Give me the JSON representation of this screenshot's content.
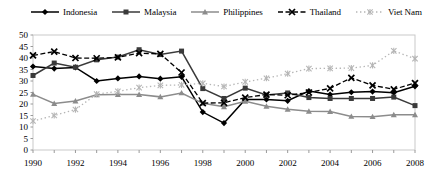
{
  "chart_data": {
    "type": "line",
    "title": "",
    "subtitle": "",
    "xlabel": "",
    "ylabel": "",
    "xlim": [
      1990,
      2008
    ],
    "ylim": [
      0,
      50
    ],
    "ytick_step": 5,
    "yticks": [
      "0",
      "5",
      "10",
      "15",
      "20",
      "25",
      "30",
      "35",
      "40",
      "45",
      "50"
    ],
    "x": [
      1990,
      1991,
      1992,
      1993,
      1994,
      1995,
      1996,
      1997,
      1998,
      1999,
      2000,
      2001,
      2002,
      2003,
      2004,
      2005,
      2006,
      2007,
      2008
    ],
    "xticks_labeled": [
      "1990",
      "1992",
      "1994",
      "1996",
      "1998",
      "2000",
      "2002",
      "2004",
      "2006",
      "2008"
    ],
    "xtick_every": 1,
    "xlabel_every": 2,
    "grid": false,
    "legend_position": "top",
    "series": [
      {
        "name": "Indonesia",
        "marker": "diamond",
        "line_style": "solid",
        "color": "#000000",
        "values": [
          36.3,
          35.4,
          35.9,
          30.0,
          31.1,
          32.0,
          31.0,
          31.8,
          16.5,
          11.7,
          22.0,
          22.0,
          21.4,
          25.6,
          24.1,
          25.1,
          25.4,
          24.9,
          27.7
        ]
      },
      {
        "name": "Malaysia",
        "marker": "square",
        "line_style": "solid",
        "color": "#3a3a3a",
        "values": [
          32.4,
          37.8,
          36.0,
          39.2,
          40.4,
          43.6,
          41.5,
          43.0,
          26.7,
          22.4,
          26.9,
          23.9,
          24.8,
          22.8,
          22.4,
          22.4,
          22.4,
          23.0,
          19.3
        ]
      },
      {
        "name": "Philippines",
        "marker": "triangle",
        "line_style": "solid",
        "color": "#8c8c8c",
        "values": [
          24.2,
          20.2,
          21.3,
          24.0,
          24.1,
          24.1,
          23.1,
          24.8,
          20.3,
          18.8,
          21.2,
          19.0,
          17.7,
          16.8,
          16.7,
          14.6,
          14.5,
          15.3,
          15.3
        ]
      },
      {
        "name": "Thailand",
        "marker": "x",
        "line_style": "dashed",
        "color": "#000000",
        "values": [
          41.1,
          42.8,
          40.0,
          39.9,
          40.3,
          42.1,
          41.8,
          33.7,
          20.4,
          20.5,
          22.8,
          24.1,
          23.8,
          25.0,
          26.8,
          31.4,
          28.1,
          26.4,
          29.1
        ]
      },
      {
        "name": "Viet Nam",
        "marker": "asterisk",
        "line_style": "dotted",
        "color": "#b5b5b5",
        "values": [
          12.6,
          15.0,
          17.6,
          24.3,
          25.5,
          27.1,
          28.1,
          28.3,
          29.0,
          27.6,
          29.6,
          31.2,
          33.2,
          35.4,
          35.5,
          35.6,
          36.8,
          43.1,
          39.7
        ]
      }
    ]
  },
  "legend": {
    "items": [
      {
        "label": "Indonesia"
      },
      {
        "label": "Malaysia"
      },
      {
        "label": "Philippines"
      },
      {
        "label": "Thailand"
      },
      {
        "label": "Viet Nam"
      }
    ]
  }
}
